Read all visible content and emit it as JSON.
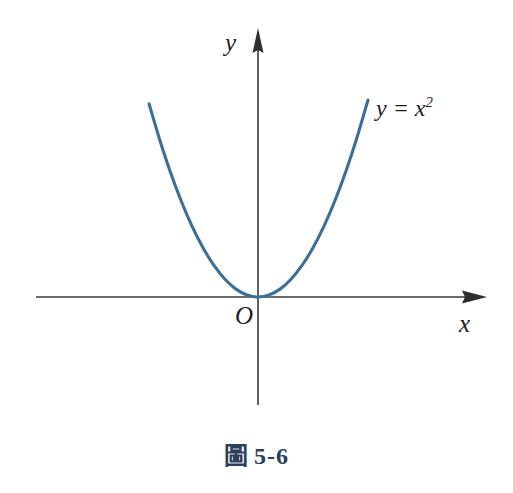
{
  "figure": {
    "caption_prefix": "圖",
    "caption_number": "5-6",
    "caption_full": "圖 5-6",
    "background_color": "#ffffff"
  },
  "axes": {
    "x_label": "x",
    "y_label": "y",
    "origin_label": "O",
    "color": "#3a3a3a",
    "stroke_width": 1.6,
    "arrowhead": "solid-triangle",
    "x_axis_start_px": 36,
    "x_axis_end_px": 487,
    "y_axis_top_px": 28,
    "y_axis_bottom_px": 405,
    "origin_px": [
      258,
      297
    ]
  },
  "curve": {
    "equation_text": "y = x",
    "equation_exponent": "2",
    "equation_full": "y = x²",
    "color": "#3a6f9a",
    "stroke_width": 3.1,
    "left_endpoint_px": [
      147,
      104
    ],
    "right_endpoint_px": [
      368,
      100
    ],
    "vertex_px": [
      258,
      297
    ]
  },
  "chart_data": {
    "type": "line",
    "subtitle": "",
    "xlabel": "x",
    "ylabel": "y",
    "grid": false,
    "legend": "none",
    "annotations": [
      {
        "text": "y = x²",
        "x": 2.15,
        "y": 4.6
      },
      {
        "text": "O",
        "x": -0.16,
        "y": -0.25
      }
    ],
    "xlim": [
      -2.6,
      2.6
    ],
    "ylim": [
      -1.2,
      5.6
    ],
    "series": [
      {
        "name": "y = x²",
        "color": "#3a6f9a",
        "x": [
          -1.98,
          -1.8,
          -1.6,
          -1.4,
          -1.2,
          -1.0,
          -0.8,
          -0.6,
          -0.4,
          -0.2,
          0.0,
          0.2,
          0.4,
          0.6,
          0.8,
          1.0,
          1.2,
          1.4,
          1.6,
          1.8,
          2.0
        ],
        "values": [
          3.92,
          3.24,
          2.56,
          1.96,
          1.44,
          1.0,
          0.64,
          0.36,
          0.16,
          0.04,
          0.0,
          0.04,
          0.16,
          0.36,
          0.64,
          1.0,
          1.44,
          1.96,
          2.56,
          3.24,
          4.0
        ]
      }
    ]
  }
}
